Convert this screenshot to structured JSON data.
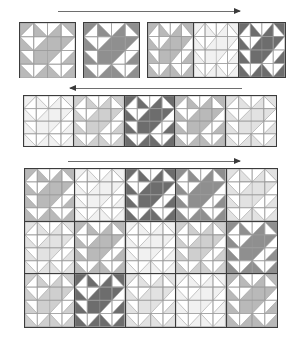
{
  "figure": {
    "background_color": "#ffffff",
    "outline_color": "#3c3c3c",
    "seam_color": "#9a9a9a"
  },
  "palette": {
    "white": "#ffffff",
    "near_white": "#fbfbfb",
    "very_light_gray": "#f1f1f1",
    "light_gray": "#e2e2e2",
    "medium_light_gray": "#cfcfcf",
    "medium_gray": "#b9b9b9",
    "dark_gray": "#8f8f8f",
    "darker_gray": "#6d6d6d",
    "arrow_color": "#6e6e6e",
    "arrow_head_color": "#3a3a3a"
  },
  "arrows": [
    {
      "name": "top-arrow",
      "direction": "right",
      "label": ""
    },
    {
      "name": "middle-arrow",
      "direction": "left",
      "label": ""
    },
    {
      "name": "bottom-arrow",
      "direction": "right",
      "label": ""
    }
  ],
  "panels": [
    {
      "name": "single-block-panel",
      "columns": 1,
      "rows": 1,
      "block_count": 1,
      "tones": [
        "medium_gray"
      ]
    },
    {
      "name": "second-block-panel",
      "columns": 1,
      "rows": 1,
      "block_count": 1,
      "tones": [
        "dark_gray"
      ]
    },
    {
      "name": "three-block-strip-panel",
      "columns": 3,
      "rows": 1,
      "block_count": 3,
      "tones": [
        "medium_gray",
        "very_light_gray",
        "darker_gray"
      ]
    },
    {
      "name": "five-block-row-panel",
      "columns": 5,
      "rows": 1,
      "block_count": 5,
      "tones": [
        "very_light_gray",
        "medium_light_gray",
        "darker_gray",
        "medium_gray",
        "light_gray"
      ]
    },
    {
      "name": "quilt-top-panel",
      "columns": 5,
      "rows": 3,
      "block_count": 15,
      "tones": [
        "medium_gray",
        "very_light_gray",
        "darker_gray",
        "dark_gray",
        "light_gray",
        "light_gray",
        "medium_gray",
        "very_light_gray",
        "medium_light_gray",
        "dark_gray",
        "medium_light_gray",
        "darker_gray",
        "light_gray",
        "very_light_gray",
        "medium_gray"
      ]
    }
  ],
  "block_motif": {
    "name": "pinwheel-windmill-block",
    "grid": "4x4 half-square-triangle units",
    "rotation": "clockwise"
  }
}
